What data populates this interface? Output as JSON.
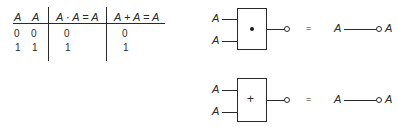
{
  "truth_table": {
    "headers": [
      "A",
      "A",
      "A · A = A",
      "A + A = A"
    ],
    "rows": [
      [
        "0",
        "0",
        "0",
        "0"
      ],
      [
        "1",
        "1",
        "1",
        "1"
      ]
    ]
  },
  "gates": [
    {
      "type": "AND",
      "symbol": "•",
      "inputs": [
        "A",
        "A"
      ],
      "equals": "=",
      "equiv_input": "A",
      "equiv_output": "A"
    },
    {
      "type": "OR",
      "symbol": "+",
      "inputs": [
        "A",
        "A"
      ],
      "equals": "=",
      "equiv_input": "A",
      "equiv_output": "A"
    }
  ]
}
